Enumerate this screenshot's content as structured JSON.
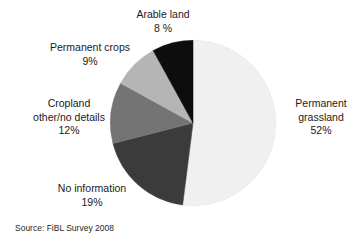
{
  "chart_data": {
    "type": "pie",
    "title": "",
    "subtitle": "",
    "legend_position": "callout-labels",
    "grid": false,
    "categories": [
      "Arable land",
      "Permanent crops",
      "Cropland other/no details",
      "No information",
      "Permanent grassland"
    ],
    "values": [
      8,
      9,
      12,
      19,
      52
    ],
    "value_labels": [
      "8 %",
      "9%",
      "12%",
      "19%",
      "52%"
    ],
    "unit": "%",
    "start_angle_deg": 0,
    "direction": "counterclockwise",
    "slices": [
      {
        "label": "Arable land",
        "value": 8,
        "value_label": "8 %",
        "color": "#0d0d0d"
      },
      {
        "label": "Permanent crops",
        "value": 9,
        "value_label": "9%",
        "color": "#b5b5b5"
      },
      {
        "label": "Cropland other/no details",
        "value": 12,
        "value_label": "12%",
        "color": "#747474"
      },
      {
        "label": "No information",
        "value": 19,
        "value_label": "19%",
        "color": "#3b3b3b"
      },
      {
        "label": "Permanent grassland",
        "value": 52,
        "value_label": "52%",
        "color": "#f0f0f0"
      }
    ]
  },
  "labels": {
    "arable_land": {
      "name": "Arable land",
      "value": "8 %"
    },
    "permanent_crops": {
      "name": "Permanent crops",
      "value": "9%"
    },
    "cropland_other": {
      "name_line1": "Cropland",
      "name_line2": "other/no details",
      "value": "12%"
    },
    "no_information": {
      "name": "No information",
      "value": "19%"
    },
    "permanent_grassland": {
      "name_line1": "Permanent",
      "name_line2": "grassland",
      "value": "52%"
    }
  },
  "source": {
    "text": "Source: FiBL Survey 2008"
  },
  "colors": {
    "background": "#ffffff",
    "text": "#1a1a1a",
    "slice_arable_land": "#0d0d0d",
    "slice_permanent_crops": "#b5b5b5",
    "slice_cropland_other": "#747474",
    "slice_no_information": "#3b3b3b",
    "slice_permanent_grassland": "#f0f0f0",
    "slice_outline": "#cfcfcf"
  }
}
